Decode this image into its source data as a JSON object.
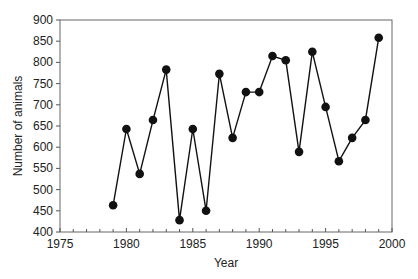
{
  "chart_data": {
    "type": "line",
    "title": "",
    "xlabel": "Year",
    "ylabel": "Number of animals",
    "xlim": [
      1975,
      2000
    ],
    "ylim": [
      400,
      900
    ],
    "x_ticks": [
      1975,
      1980,
      1985,
      1990,
      1995,
      2000
    ],
    "y_ticks": [
      400,
      450,
      500,
      550,
      600,
      650,
      700,
      750,
      800,
      850,
      900
    ],
    "x_minor_ticks_every": 1,
    "grid": false,
    "legend": null,
    "marker": "filled-circle",
    "series": [
      {
        "name": "Number of animals",
        "color": "#111111",
        "x": [
          1979,
          1980,
          1981,
          1982,
          1983,
          1984,
          1985,
          1986,
          1987,
          1988,
          1989,
          1990,
          1991,
          1992,
          1993,
          1994,
          1995,
          1996,
          1997,
          1998,
          1999
        ],
        "values": [
          463,
          643,
          537,
          664,
          783,
          428,
          643,
          450,
          773,
          622,
          730,
          730,
          815,
          805,
          589,
          825,
          695,
          567,
          622,
          664,
          858
        ]
      }
    ]
  },
  "plot_area": {
    "left": 60,
    "top": 20,
    "right": 392,
    "bottom": 232
  }
}
